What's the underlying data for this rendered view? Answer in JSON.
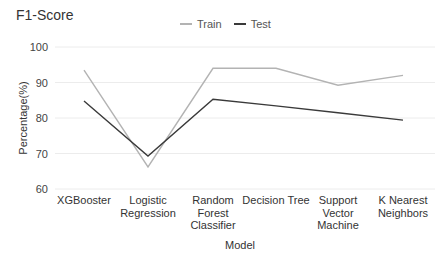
{
  "chart_data": {
    "type": "line",
    "title": "F1-Score",
    "xlabel": "Model",
    "ylabel": "Percentage(%)",
    "ylim": [
      60,
      100
    ],
    "yticks": [
      60,
      70,
      80,
      90,
      100
    ],
    "grid": true,
    "legend_position": "top",
    "categories": [
      "XGBooster",
      "Logistic Regression",
      "Random Forest Classifier",
      "Decision Tree",
      "Support Vector Machine",
      "K Nearest Neighbors"
    ],
    "category_lines": [
      [
        "XGBooster"
      ],
      [
        "Logistic",
        "Regression"
      ],
      [
        "Random",
        "Forest",
        "Classifier"
      ],
      [
        "Decision Tree"
      ],
      [
        "Support",
        "Vector",
        "Machine"
      ],
      [
        "K Nearest",
        "Neighbors"
      ]
    ],
    "series": [
      {
        "name": "Train",
        "color": "#b3b3b3",
        "values": [
          93.5,
          66.2,
          94.0,
          94.0,
          89.2,
          92.0
        ]
      },
      {
        "name": "Test",
        "color": "#3a3a3a",
        "values": [
          84.8,
          69.3,
          85.3,
          83.4,
          81.5,
          79.4
        ]
      }
    ]
  }
}
